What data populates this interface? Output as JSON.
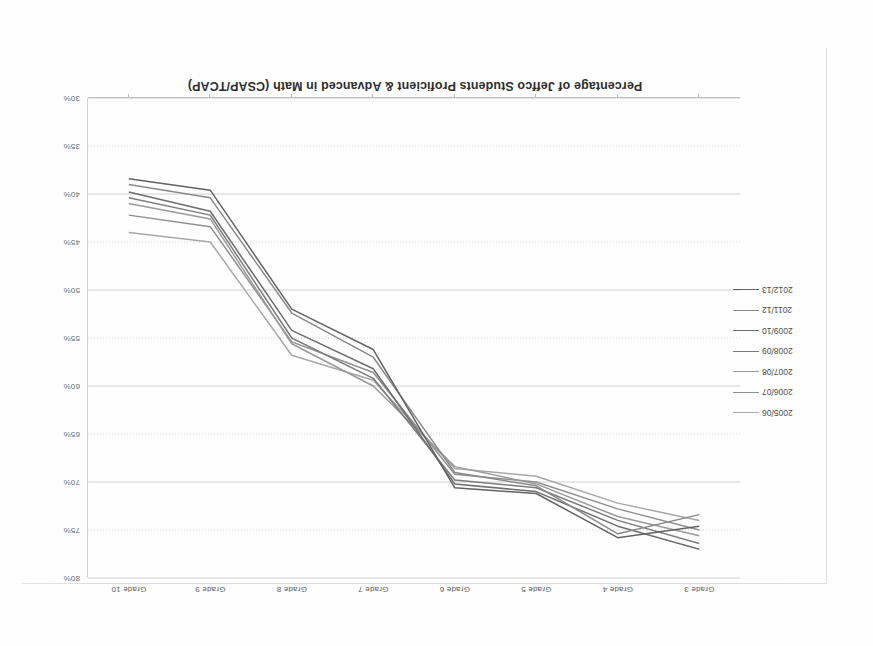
{
  "chart_data": {
    "type": "line",
    "title": "Percentage of Jeffco Students Proficient & Advanced in Math (CSAP/TCAP)",
    "xlabel": "",
    "ylabel": "",
    "categories": [
      "Grade 3",
      "Grade 4",
      "Grade 5",
      "Grade 6",
      "Grade 7",
      "Grade 8",
      "Grade 9",
      "Grade 10"
    ],
    "ylim": [
      30,
      80
    ],
    "yticks": [
      "30%",
      "35%",
      "40%",
      "45%",
      "50%",
      "55%",
      "60%",
      "65%",
      "70%",
      "75%",
      "80%"
    ],
    "ytick_values": [
      30,
      35,
      40,
      45,
      50,
      55,
      60,
      65,
      70,
      75,
      80
    ],
    "grid": true,
    "legend_position": "left",
    "y_axis_position": "right",
    "orientation_note": "page scanned upside down (rotated 180 degrees)",
    "series": [
      {
        "name": "2005/06",
        "color": "#a8a8a8",
        "values": [
          74.0,
          72.2,
          69.4,
          68.6,
          59.4,
          56.8,
          45.0,
          44.0
        ]
      },
      {
        "name": "2006/07",
        "color": "#8f8f8f",
        "values": [
          75.0,
          72.8,
          70.0,
          69.2,
          58.6,
          55.4,
          43.4,
          42.2
        ]
      },
      {
        "name": "2007/08",
        "color": "#9a9a9a",
        "values": [
          75.6,
          73.6,
          70.2,
          68.4,
          60.0,
          55.6,
          42.6,
          41.0
        ]
      },
      {
        "name": "2008/09",
        "color": "#7c7c7c",
        "values": [
          76.4,
          74.0,
          70.6,
          69.8,
          59.2,
          55.0,
          42.2,
          40.4
        ]
      },
      {
        "name": "2009/10",
        "color": "#6e6e6e",
        "values": [
          77.0,
          74.6,
          71.0,
          70.2,
          58.2,
          54.2,
          41.8,
          39.8
        ]
      },
      {
        "name": "2011/12",
        "color": "#8a8a8a",
        "values": [
          73.4,
          75.4,
          70.4,
          69.0,
          57.0,
          52.4,
          40.4,
          39.0
        ]
      },
      {
        "name": "2012/13",
        "color": "#636363",
        "values": [
          74.6,
          75.8,
          71.2,
          70.6,
          56.2,
          52.0,
          39.6,
          38.4
        ]
      }
    ]
  },
  "legend": {
    "items": [
      {
        "label": "2005/06"
      },
      {
        "label": "2006/07"
      },
      {
        "label": "2007/08"
      },
      {
        "label": "2008/09"
      },
      {
        "label": "2009/10"
      },
      {
        "label": "2011/12"
      },
      {
        "label": "2012/13"
      }
    ]
  }
}
